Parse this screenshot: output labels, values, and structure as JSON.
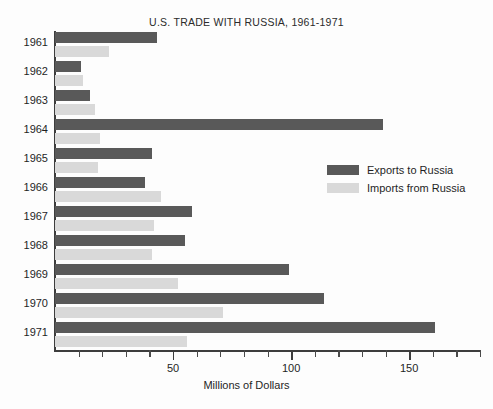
{
  "chart_data": {
    "type": "bar",
    "orientation": "horizontal",
    "title": "U.S. TRADE WITH RUSSIA, 1961-1971",
    "xlabel": "Millions of Dollars",
    "ylabel": "",
    "xlim": [
      0,
      180
    ],
    "xticks_major": [
      50,
      100,
      150
    ],
    "xtick_labels": [
      "50",
      "100",
      "150"
    ],
    "xticks_minor": [
      10,
      20,
      30,
      40,
      60,
      70,
      80,
      90,
      110,
      120,
      130,
      140,
      160,
      170,
      180
    ],
    "grid": false,
    "legend_position": "center-right",
    "categories": [
      "1961",
      "1962",
      "1963",
      "1964",
      "1965",
      "1966",
      "1967",
      "1968",
      "1969",
      "1970",
      "1971"
    ],
    "series": [
      {
        "name": "Exports to Russia",
        "color": "#595959",
        "values": [
          43,
          11,
          15,
          139,
          41,
          38,
          58,
          55,
          99,
          114,
          161
        ]
      },
      {
        "name": "Imports from Russia",
        "color": "#d9d9d9",
        "values": [
          23,
          12,
          17,
          19,
          18,
          45,
          42,
          41,
          52,
          71,
          56
        ]
      }
    ]
  },
  "legend": {
    "entries": [
      {
        "label": "Exports to Russia",
        "color": "#595959"
      },
      {
        "label": "Imports from Russia",
        "color": "#d9d9d9"
      }
    ]
  }
}
